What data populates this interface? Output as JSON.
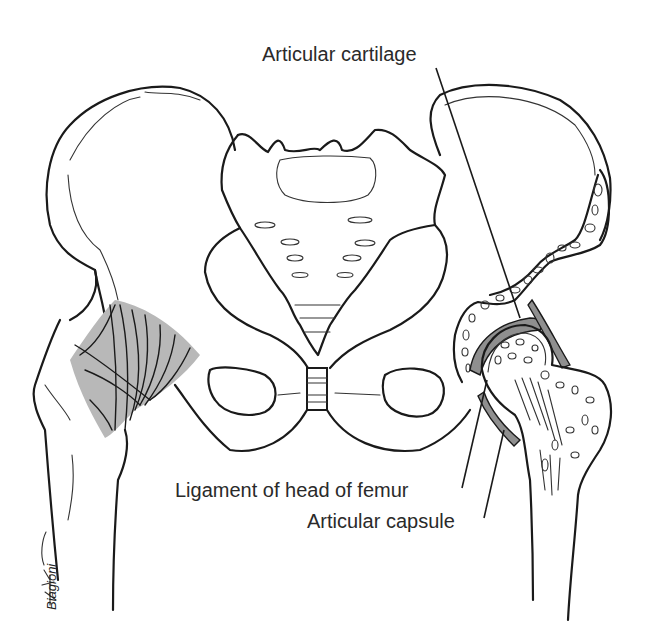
{
  "figure": {
    "labels": [
      {
        "id": "articular-cartilage",
        "text": "Articular cartilage"
      },
      {
        "id": "ligament-head-femur",
        "text": "Ligament of head of femur"
      },
      {
        "id": "articular-capsule",
        "text": "Articular capsule"
      }
    ],
    "signature": "Biagioni",
    "colors": {
      "ink": "#1a1a1a",
      "muscle_shade": "#b8b8b8",
      "cartilage_shade": "#8f8f8f",
      "background": "#ffffff"
    }
  }
}
